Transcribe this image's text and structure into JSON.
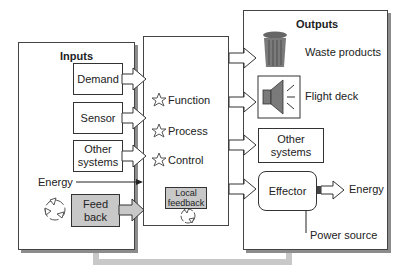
{
  "diagram": {
    "inputs": {
      "title": "Inputs",
      "items": [
        {
          "label": "Demand"
        },
        {
          "label": "Sensor"
        },
        {
          "label": "Other systems"
        }
      ],
      "energy_label": "Energy",
      "feedback_label": "Feed back",
      "recycle_icon": "recycle-icon"
    },
    "process": {
      "items": [
        {
          "icon": "star-icon",
          "label": "Function"
        },
        {
          "icon": "star-icon",
          "label": "Process"
        },
        {
          "icon": "star-icon",
          "label": "Control"
        }
      ],
      "local_feedback_label": "Local feedback"
    },
    "outputs": {
      "title": "Outputs",
      "waste_label": "Waste products",
      "flight_deck_label": "Flight deck",
      "other_systems_label": "Other systems",
      "effector_label": "Effector",
      "energy_label": "Energy",
      "power_source_label": "Power source"
    },
    "colors": {
      "feedback_fill": "#c8c8c8",
      "feedback_line": "#c8c8c8",
      "shadow": "#8c8c8c",
      "icon_gray": "#7a7a7a"
    }
  }
}
